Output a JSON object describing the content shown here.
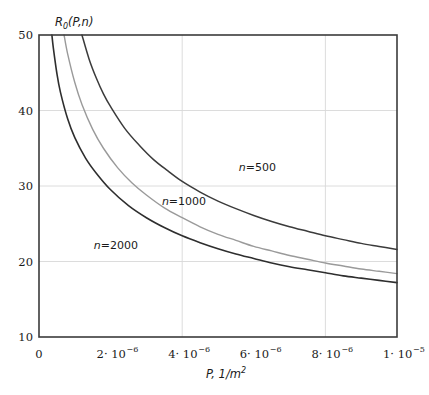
{
  "chart_data": {
    "type": "line",
    "title": "",
    "ylabel": "R0(P,n)",
    "ylabel_base": "R",
    "ylabel_sub": "0",
    "ylabel_rest": "(P,n)",
    "xlabel": "P, 1/m2",
    "xlabel_main": "P, 1/m",
    "xlabel_sup": "2",
    "xlim": [
      0,
      1e-05
    ],
    "ylim": [
      10,
      50
    ],
    "grid": true,
    "legend": "inline-curve-labels",
    "x_ticks": [
      {
        "value": 0,
        "mantissa": "0",
        "base": "",
        "exp": ""
      },
      {
        "value": 2e-06,
        "mantissa": "2",
        "base": "10",
        "exp": "−6"
      },
      {
        "value": 4e-06,
        "mantissa": "4",
        "base": "10",
        "exp": "−6"
      },
      {
        "value": 6e-06,
        "mantissa": "6",
        "base": "10",
        "exp": "−6"
      },
      {
        "value": 8e-06,
        "mantissa": "8",
        "base": "10",
        "exp": "−6"
      },
      {
        "value": 1e-05,
        "mantissa": "1",
        "base": "10",
        "exp": "−5"
      }
    ],
    "y_ticks": [
      {
        "value": 10,
        "label": "10"
      },
      {
        "value": 20,
        "label": "20"
      },
      {
        "value": 30,
        "label": "30"
      },
      {
        "value": 40,
        "label": "40"
      },
      {
        "value": 50,
        "label": "50"
      }
    ],
    "x_gridlines": [
      4e-06,
      8e-06
    ],
    "y_gridlines": [
      20,
      30,
      40
    ],
    "series": [
      {
        "name": "n=500",
        "label": "n=500",
        "n": 500,
        "color": "#3b3b3b",
        "width": 1.5,
        "annotation_x": 6.1e-06,
        "annotation_y": 32.0,
        "x": [
          1.2e-06,
          1.4e-06,
          1.6e-06,
          1.8e-06,
          2e-06,
          2.4e-06,
          2.8e-06,
          3.2e-06,
          3.6e-06,
          4e-06,
          4.5e-06,
          5e-06,
          5.5e-06,
          6e-06,
          6.5e-06,
          7e-06,
          7.5e-06,
          8e-06,
          8.5e-06,
          9e-06,
          9.5e-06,
          1e-05
        ],
        "y": [
          50.0,
          46.8,
          44.3,
          42.2,
          40.5,
          37.6,
          35.4,
          33.5,
          32.0,
          30.6,
          29.2,
          28.0,
          27.0,
          26.1,
          25.3,
          24.6,
          24.0,
          23.4,
          22.9,
          22.4,
          22.0,
          21.6
        ]
      },
      {
        "name": "n=1000",
        "label": "n=1000",
        "n": 1000,
        "color": "#9a9a9a",
        "width": 1.4,
        "annotation_x": 4.05e-06,
        "annotation_y": 27.5,
        "x": [
          7e-07,
          8e-07,
          1e-06,
          1.2e-06,
          1.5e-06,
          1.8e-06,
          2.2e-06,
          2.6e-06,
          3e-06,
          3.5e-06,
          4e-06,
          4.5e-06,
          5e-06,
          5.5e-06,
          6e-06,
          6.5e-06,
          7e-06,
          7.5e-06,
          8e-06,
          8.5e-06,
          9e-06,
          9.5e-06,
          1e-05
        ],
        "y": [
          50.0,
          47.5,
          43.7,
          40.8,
          37.5,
          35.0,
          32.4,
          30.4,
          28.8,
          27.1,
          25.8,
          24.6,
          23.6,
          22.8,
          22.0,
          21.4,
          20.8,
          20.3,
          19.8,
          19.4,
          19.0,
          18.7,
          18.4
        ]
      },
      {
        "name": "n=2000",
        "label": "n=2000",
        "n": 2000,
        "color": "#2e2e2e",
        "width": 1.6,
        "annotation_x": 2.15e-06,
        "annotation_y": 21.6,
        "x": [
          3.6e-07,
          4e-07,
          5e-07,
          6e-07,
          8e-07,
          1e-06,
          1.3e-06,
          1.6e-06,
          2e-06,
          2.5e-06,
          3e-06,
          3.5e-06,
          4e-06,
          4.5e-06,
          5e-06,
          5.5e-06,
          6e-06,
          6.5e-06,
          7e-06,
          7.5e-06,
          8e-06,
          8.5e-06,
          9e-06,
          9.5e-06,
          1e-05
        ],
        "y": [
          50.0,
          48.3,
          44.9,
          42.4,
          38.9,
          36.4,
          33.7,
          31.7,
          29.5,
          27.4,
          25.8,
          24.5,
          23.4,
          22.5,
          21.7,
          21.0,
          20.4,
          19.8,
          19.3,
          18.9,
          18.5,
          18.1,
          17.8,
          17.5,
          17.2
        ]
      }
    ]
  },
  "figure": {
    "plot_left": 39,
    "plot_right": 397,
    "plot_top": 35,
    "plot_bottom": 337
  }
}
